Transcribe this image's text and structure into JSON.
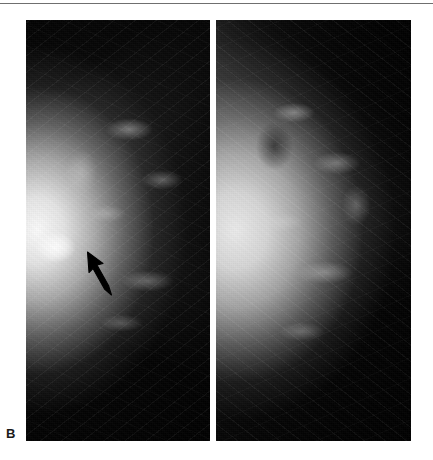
{
  "figure": {
    "label": "B",
    "modality": "mammogram",
    "caption_letter": "B",
    "panel_count": 2
  },
  "panels": [
    {
      "id": "left-mammogram",
      "name": "left-breast-view",
      "side": "left",
      "background_color": "#070707",
      "tissue_highlight_color": "#f2f2f2",
      "has_annotation": true,
      "annotation": {
        "type": "arrow",
        "name": "lesion-arrow",
        "color": "#000000",
        "direction": "up-left",
        "points_to": "subareolar-density"
      }
    },
    {
      "id": "right-mammogram",
      "name": "right-breast-view",
      "side": "right",
      "background_color": "#0a0a0a",
      "tissue_highlight_color": "#ededed",
      "has_annotation": false
    }
  ],
  "page": {
    "background_color": "#ffffff",
    "rule_color": "#6f6f6f",
    "width": 433,
    "height": 460
  }
}
